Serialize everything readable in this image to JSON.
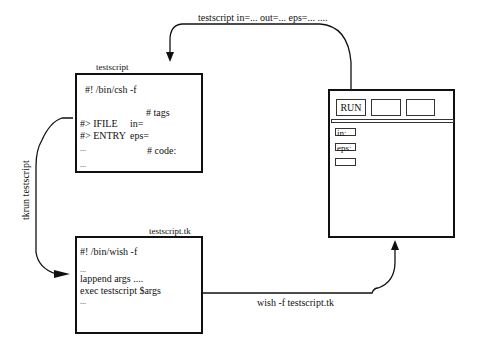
{
  "edges": {
    "top_label": "testscript in=... out=... eps=...  ....",
    "left_label": "tkrun testscript",
    "bottom_label": "wish -f testscript.tk"
  },
  "testscript_box": {
    "title": "testscript",
    "lines": [
      "#! /bin/csh -f",
      "# tags",
      "#> IFILE",
      "in=",
      "#> ENTRY",
      "eps=",
      "...",
      "# code:",
      "..."
    ]
  },
  "tk_box": {
    "title": "testscript.tk",
    "lines": [
      "#! /bin/wish  -f",
      "...",
      "lappend args ....",
      "exec testscript $args",
      "..."
    ]
  },
  "gui_window": {
    "buttons": [
      "RUN",
      "",
      ""
    ],
    "fields": [
      "in:",
      "eps:",
      ""
    ]
  }
}
